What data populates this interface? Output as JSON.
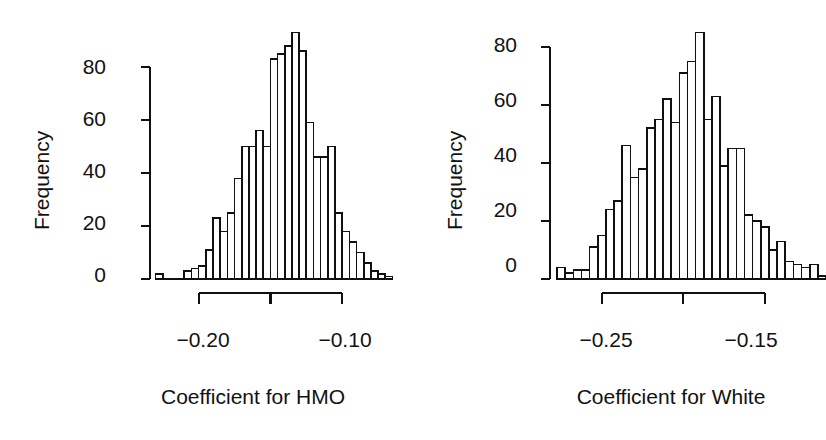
{
  "figure": {
    "width": 826,
    "height": 440,
    "background": "#ffffff",
    "foreground": "#101010",
    "panels": 2
  },
  "chart_data": [
    {
      "type": "bar",
      "subtype": "histogram",
      "panel": "left",
      "title": "",
      "xlabel": "Coefficient for HMO",
      "ylabel": "Frequency",
      "grid": false,
      "legend": "none",
      "xlim": [
        -0.2325,
        -0.0625
      ],
      "ylim": [
        0,
        95
      ],
      "xticks": [
        -0.2,
        -0.15,
        -0.1
      ],
      "xtick_labels": [
        "−0.20",
        "",
        "−0.10"
      ],
      "yticks": [
        0,
        20,
        40,
        60,
        80
      ],
      "ytick_labels": [
        "0",
        "20",
        "40",
        "60",
        "80"
      ],
      "bin_width": 0.005,
      "bin_starts": [
        -0.23,
        -0.225,
        -0.22,
        -0.215,
        -0.21,
        -0.205,
        -0.2,
        -0.195,
        -0.19,
        -0.185,
        -0.18,
        -0.175,
        -0.17,
        -0.165,
        -0.16,
        -0.155,
        -0.15,
        -0.145,
        -0.14,
        -0.135,
        -0.13,
        -0.125,
        -0.12,
        -0.115,
        -0.11,
        -0.105,
        -0.1,
        -0.095,
        -0.09,
        -0.085,
        -0.08,
        -0.075,
        -0.07
      ],
      "values": [
        2,
        0,
        0,
        0,
        3,
        4,
        5,
        11,
        23,
        18,
        25,
        38,
        50,
        50,
        56,
        50,
        83,
        85,
        88,
        93,
        86,
        59,
        46,
        46,
        50,
        25,
        18,
        14,
        10,
        6,
        3,
        2,
        1
      ]
    },
    {
      "type": "bar",
      "subtype": "histogram",
      "panel": "right",
      "title": "",
      "xlabel": "Coefficient for White",
      "ylabel": "Frequency",
      "grid": false,
      "legend": "none",
      "xlim": [
        -0.28,
        -0.1125
      ],
      "ylim": [
        0,
        95
      ],
      "xticks": [
        -0.25,
        -0.2,
        -0.15
      ],
      "xtick_labels": [
        "−0.25",
        "",
        "−0.15"
      ],
      "yticks": [
        0,
        20,
        40,
        60,
        80
      ],
      "ytick_labels": [
        "0",
        "20",
        "40",
        "60",
        "80"
      ],
      "bin_width": 0.005,
      "bin_starts": [
        -0.2775,
        -0.2725,
        -0.2675,
        -0.2625,
        -0.2575,
        -0.2525,
        -0.2475,
        -0.2425,
        -0.2375,
        -0.2325,
        -0.2275,
        -0.2225,
        -0.2175,
        -0.2125,
        -0.2075,
        -0.2025,
        -0.1975,
        -0.1925,
        -0.1875,
        -0.1825,
        -0.1775,
        -0.1725,
        -0.1675,
        -0.1625,
        -0.1575,
        -0.1525,
        -0.1475,
        -0.1425,
        -0.1375,
        -0.1325,
        -0.1275,
        -0.1225,
        -0.1175
      ],
      "values": [
        4,
        2,
        3,
        3,
        11,
        15,
        24,
        27,
        46,
        35,
        38,
        52,
        55,
        62,
        54,
        71,
        75,
        85,
        55,
        63,
        39,
        45,
        45,
        22,
        20,
        18,
        10,
        13,
        6,
        5,
        4,
        5,
        1
      ]
    }
  ],
  "panel_left": {
    "name": "coefficient-for-hmo-histogram",
    "ylabel": "Frequency",
    "xlabel": "Coefficient for HMO",
    "ytick_labels": [
      "80",
      "60",
      "40",
      "20",
      "0"
    ],
    "xtick_labels": [
      "−0.20",
      "−0.10"
    ]
  },
  "panel_right": {
    "name": "coefficient-for-white-histogram",
    "ylabel": "Frequency",
    "xlabel": "Coefficient for White",
    "ytick_labels": [
      "80",
      "60",
      "40",
      "20",
      "0"
    ],
    "xtick_labels": [
      "−0.25",
      "−0.15"
    ]
  }
}
